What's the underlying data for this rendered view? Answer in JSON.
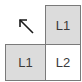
{
  "diagram": {
    "arrow": {
      "direction": "up-left",
      "color": "#1a1a1a"
    },
    "cells": [
      {
        "position": "top-right",
        "label": "L1",
        "fill": "#dcdcdc"
      },
      {
        "position": "bottom-left",
        "label": "L1",
        "fill": "#dcdcdc"
      },
      {
        "position": "bottom-right",
        "label": "L2",
        "fill": "#ffffff"
      }
    ],
    "border_color": "#7a7a7a",
    "text_color": "#3a3a3a"
  }
}
